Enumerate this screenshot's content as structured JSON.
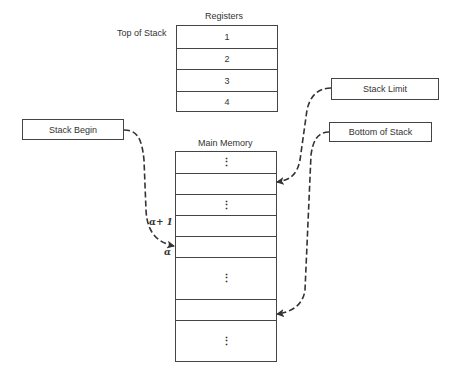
{
  "registers": {
    "title": "Registers",
    "top_label": "Top of Stack",
    "cells": [
      "1",
      "2",
      "3",
      "4"
    ]
  },
  "memory": {
    "title": "Main Memory",
    "cells": [
      "⋮",
      "",
      "⋮",
      "",
      "",
      "⋮",
      "",
      "⋮"
    ],
    "alpha_plus_one_label": "α+ 1",
    "alpha_label": "α"
  },
  "callouts": {
    "stack_begin": "Stack Begin",
    "stack_limit": "Stack Limit",
    "bottom_of_stack": "Bottom of Stack"
  },
  "colors": {
    "line": "#444444",
    "text": "#333333"
  }
}
